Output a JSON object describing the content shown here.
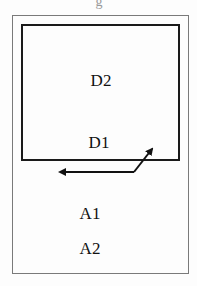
{
  "diagram": {
    "top_fragment": "g",
    "regions": {
      "inner_box": {
        "labels": [
          "D2",
          "D1"
        ]
      },
      "outer_box": {
        "labels": [
          "A1",
          "A2"
        ]
      }
    },
    "labels": {
      "d2": "D2",
      "d1": "D1",
      "a1": "A1",
      "a2": "A2"
    },
    "arrow": {
      "type": "double-headed bent arrow",
      "from": "inside inner box (toward D1)",
      "to": "outer area (left)"
    },
    "colors": {
      "inner_border": "#1a1a1a",
      "outer_border": "#7a7a7a",
      "text": "#111111",
      "background": "#fdfdfd"
    }
  }
}
